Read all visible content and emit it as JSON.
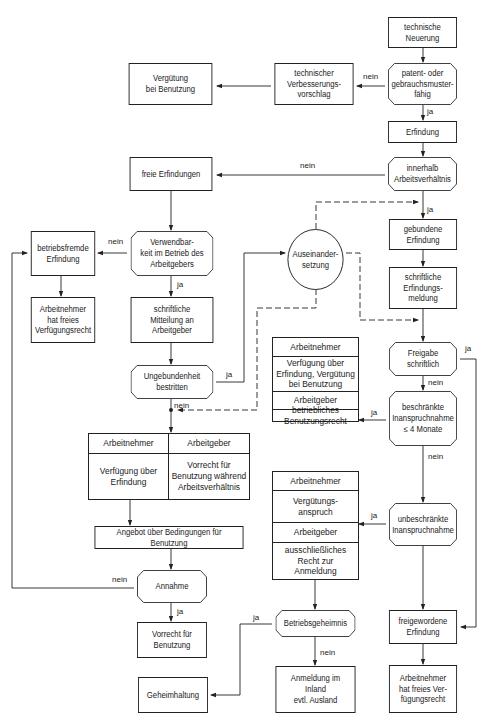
{
  "diagram": {
    "nodes": {
      "technische_neuerung": "technische\nNeuerung",
      "patentfaehig": "patent- oder\ngebrauchsmuster-\nfähig",
      "erfindung": "Erfindung",
      "innerhalb": "innerhalb\nArbeitsverhältnis",
      "verbesserungsvorschlag": "technischer\nVerbesserungs-\nvorschlag",
      "verguetung_benutzung": "Vergütung\nbei Benutzung",
      "freie_erfindungen": "freie Erfindungen",
      "verwendbarkeit": "Verwendbar-\nkeit im Betrieb des\nArbeitgebers",
      "betriebsfremde": "betriebsfremde\nErfindung",
      "an_freies_recht_left": "Arbeitnehmer\nhat freies\nVerfügungsrecht",
      "schriftliche_mitteilung": "schriftliche\nMitteilung an\nArbeitgeber",
      "ungebundenheit": "Ungebundenheit\nbestritten",
      "auseinandersetzung": "Auseinander-\nsetzung",
      "gebundene": "gebundene\nErfindung",
      "erfindungsmeldung": "schriftliche\nErfindungs-\nmeldung",
      "freigabe": "Freigabe\nschriftlich",
      "beschraenkte": "beschränkte\nInanspruchnahme\n≤ 4 Monate",
      "unbeschraenkte": "unbeschränkte\nInanspruchnahme",
      "angebot": "Angebot über Bedingungen für Benutzung",
      "annahme": "Annahme",
      "vorrecht_benutzung": "Vorrecht für\nBenutzung",
      "geheimhaltung": "Geheimhaltung",
      "betriebsgeheimnis": "Betriebsgeheimnis",
      "anmeldung": "Anmeldung im\nInland\nevtl. Ausland",
      "freigewordene": "freigewordene\nErfindung",
      "an_freies_recht_right": "Arbeitnehmer\nhat freies Ver-\nfügungsrecht"
    },
    "split_beschraenkt": {
      "an_head": "Arbeitnehmer",
      "an_body": "Verfügung über\nErfindung, Vergütung\nbei Benutzung",
      "ag_head": "Arbeitgeber",
      "ag_body": "betriebliches\nBenutzungsrecht"
    },
    "split_unbeschraenkt": {
      "an_head": "Arbeitnehmer",
      "an_body": "Vergütungs-\nanspruch",
      "ag_head": "Arbeitgeber",
      "ag_body": "ausschließliches\nRecht zur\nAnmeldung"
    },
    "split_ungebunden": {
      "an_head": "Arbeitnehmer",
      "an_body": "Verfügung über\nErfindung",
      "ag_head": "Arbeitgeber",
      "ag_body": "Vorrecht für\nBenutzung während\nArbeitsverhältnis"
    },
    "labels": {
      "ja": "ja",
      "nein": "nein"
    },
    "colors": {
      "line": "#222222",
      "background": "#ffffff"
    }
  }
}
